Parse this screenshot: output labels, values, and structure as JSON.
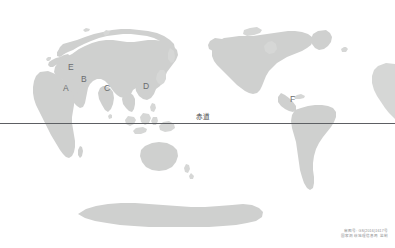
{
  "map": {
    "title": "World Map with Equator",
    "projection": "pacific-centered world map",
    "land_color": "#cfd0cf",
    "equator": {
      "label": "赤道",
      "label_x": 196,
      "label_y": 114,
      "line_y": 123,
      "line_color": "#5d5f63"
    },
    "region_labels": [
      {
        "id": "A",
        "text": "A",
        "x": 63,
        "y": 84,
        "region_hint": "Arabia / Northeast Africa"
      },
      {
        "id": "B",
        "text": "B",
        "x": 81,
        "y": 75,
        "region_hint": "Caspian / West Asia"
      },
      {
        "id": "C",
        "text": "C",
        "x": 104,
        "y": 84,
        "region_hint": "South Asia"
      },
      {
        "id": "D",
        "text": "D",
        "x": 143,
        "y": 82,
        "region_hint": "East Asia"
      },
      {
        "id": "E",
        "text": "E",
        "x": 68,
        "y": 63,
        "region_hint": "Europe"
      },
      {
        "id": "F",
        "text": "F",
        "x": 290,
        "y": 95,
        "region_hint": "Central America"
      }
    ],
    "credit": {
      "line1": "审图号: GS(2016)1617号",
      "line2": "国家测绘地理信息局 监制"
    }
  }
}
